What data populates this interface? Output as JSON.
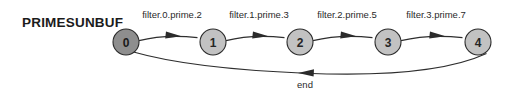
{
  "diagram": {
    "title": "PRIMESUNBUF",
    "width": 510,
    "height": 100,
    "background": "#ffffff",
    "type": "directed-graph",
    "nodes": [
      {
        "id": "0",
        "label": "0",
        "cx": 126,
        "cy": 42,
        "r": 13,
        "fill": "#8e8e8e",
        "stroke": "#2b2b2b"
      },
      {
        "id": "1",
        "label": "1",
        "cx": 213,
        "cy": 42,
        "r": 13,
        "fill": "#c2c2c2",
        "stroke": "#2b2b2b"
      },
      {
        "id": "2",
        "label": "2",
        "cx": 300,
        "cy": 42,
        "r": 13,
        "fill": "#c2c2c2",
        "stroke": "#2b2b2b"
      },
      {
        "id": "3",
        "label": "3",
        "cx": 388,
        "cy": 42,
        "r": 13,
        "fill": "#c2c2c2",
        "stroke": "#2b2b2b"
      },
      {
        "id": "4",
        "label": "4",
        "cx": 478,
        "cy": 42,
        "r": 13,
        "fill": "#c2c2c2",
        "stroke": "#2b2b2b"
      }
    ],
    "edges": [
      {
        "id": "e0",
        "from": "0",
        "to": "1",
        "label": "filter.0.prime.2",
        "label_x": 172,
        "label_y": 18
      },
      {
        "id": "e1",
        "from": "1",
        "to": "2",
        "label": "filter.1.prime.3",
        "label_x": 259,
        "label_y": 18
      },
      {
        "id": "e2",
        "from": "2",
        "to": "3",
        "label": "filter.2.prime.5",
        "label_x": 347,
        "label_y": 18
      },
      {
        "id": "e3",
        "from": "3",
        "to": "4",
        "label": "filter.3.prime.7",
        "label_x": 436,
        "label_y": 18
      },
      {
        "id": "e4",
        "from": "4",
        "to": "0",
        "label": "end",
        "label_x": 305,
        "label_y": 88
      }
    ],
    "colors": {
      "node_start_fill": "#8e8e8e",
      "node_fill": "#c2c2c2",
      "stroke": "#2b2b2b",
      "text": "#1b1b1b"
    }
  }
}
